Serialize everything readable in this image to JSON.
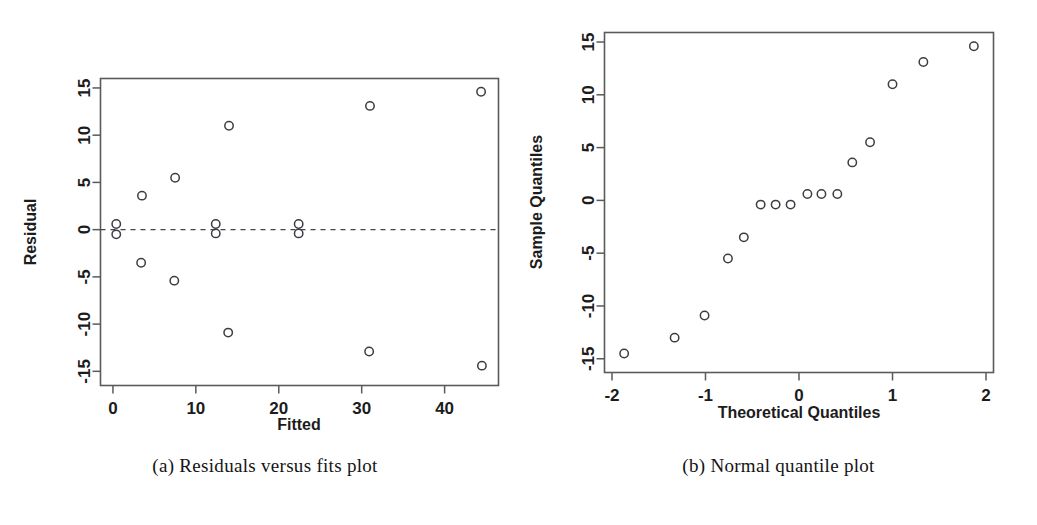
{
  "figure": {
    "background_color": "#ffffff",
    "point_color": "#3c3c44",
    "axis_color": "#5a5a5a"
  },
  "panel_a": {
    "caption": "(a) Residuals versus fits plot"
  },
  "panel_b": {
    "caption": "(b) Normal quantile plot"
  },
  "chart_data": [
    {
      "type": "scatter",
      "id": "residuals-vs-fits",
      "title": "",
      "xlabel": "Fitted",
      "ylabel": "Residual",
      "xlim": [
        -1.5,
        46.5
      ],
      "ylim": [
        -16.5,
        16.0
      ],
      "xticks": [
        0,
        10,
        20,
        30,
        40
      ],
      "xticklabels": [
        "0",
        "10",
        "20",
        "30",
        "40"
      ],
      "yticks": [
        -15,
        -10,
        -5,
        0,
        5,
        10,
        15
      ],
      "yticklabels": [
        "-15",
        "-10",
        "-5",
        "0",
        "5",
        "10",
        "15"
      ],
      "grid": false,
      "legend": "none",
      "reference_line": {
        "type": "horizontal-dashed",
        "y": 0
      },
      "marker": "open-circle",
      "points": [
        {
          "x": 0.4,
          "y": 0.6
        },
        {
          "x": 0.4,
          "y": -0.5
        },
        {
          "x": 3.5,
          "y": 3.6
        },
        {
          "x": 3.4,
          "y": -3.5
        },
        {
          "x": 7.5,
          "y": 5.5
        },
        {
          "x": 7.4,
          "y": -5.4
        },
        {
          "x": 12.4,
          "y": 0.6
        },
        {
          "x": 12.4,
          "y": -0.4
        },
        {
          "x": 14.0,
          "y": 11.0
        },
        {
          "x": 13.9,
          "y": -10.9
        },
        {
          "x": 22.4,
          "y": 0.6
        },
        {
          "x": 22.4,
          "y": -0.4
        },
        {
          "x": 31.0,
          "y": 13.1
        },
        {
          "x": 30.9,
          "y": -12.9
        },
        {
          "x": 44.4,
          "y": 14.6
        },
        {
          "x": 44.5,
          "y": -14.4
        }
      ]
    },
    {
      "type": "scatter",
      "id": "normal-quantile-plot",
      "title": "",
      "xlabel": "Theoretical Quantiles",
      "ylabel": "Sample Quantiles",
      "xlim": [
        -2.08,
        2.08
      ],
      "ylim": [
        -16.3,
        15.9
      ],
      "xticks": [
        -2,
        -1,
        0,
        1,
        2
      ],
      "xticklabels": [
        "-2",
        "-1",
        "0",
        "1",
        "2"
      ],
      "yticks": [
        -15,
        -10,
        -5,
        0,
        5,
        10,
        15
      ],
      "yticklabels": [
        "-15",
        "-10",
        "-5",
        "0",
        "5",
        "10",
        "15"
      ],
      "grid": false,
      "legend": "none",
      "marker": "open-circle",
      "points": [
        {
          "x": -1.87,
          "y": -14.5
        },
        {
          "x": -1.33,
          "y": -13.0
        },
        {
          "x": -1.01,
          "y": -10.9
        },
        {
          "x": -0.76,
          "y": -5.5
        },
        {
          "x": -0.59,
          "y": -3.5
        },
        {
          "x": -0.41,
          "y": -0.4
        },
        {
          "x": -0.25,
          "y": -0.4
        },
        {
          "x": -0.09,
          "y": -0.4
        },
        {
          "x": 0.09,
          "y": 0.6
        },
        {
          "x": 0.24,
          "y": 0.6
        },
        {
          "x": 0.41,
          "y": 0.6
        },
        {
          "x": 0.57,
          "y": 3.6
        },
        {
          "x": 0.76,
          "y": 5.5
        },
        {
          "x": 1.0,
          "y": 11.0
        },
        {
          "x": 1.33,
          "y": 13.1
        },
        {
          "x": 1.87,
          "y": 14.6
        }
      ]
    }
  ]
}
